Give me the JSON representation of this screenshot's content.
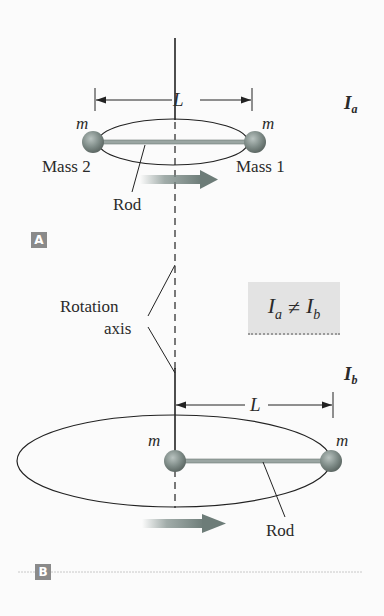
{
  "panel_a": {
    "tag": "A",
    "inertia_label": "I",
    "inertia_sub": "a",
    "length_label": "L",
    "mass_left_symbol": "m",
    "mass_right_symbol": "m",
    "mass_left_name": "Mass 2",
    "mass_right_name": "Mass 1",
    "rod_label": "Rod"
  },
  "axis_label_line1": "Rotation",
  "axis_label_line2": "axis",
  "comparison": {
    "left": "I",
    "left_sub": "a",
    "operator": "≠",
    "right": "I",
    "right_sub": "b"
  },
  "panel_b": {
    "tag": "B",
    "inertia_label": "I",
    "inertia_sub": "b",
    "length_label": "L",
    "mass_left_symbol": "m",
    "mass_right_symbol": "m",
    "rod_label": "Rod"
  },
  "colors": {
    "sphere": "#7d8a86",
    "arrow": "#7a8a86",
    "tag_bg": "#8a8a8a",
    "box_bg": "#e3e3e3"
  }
}
